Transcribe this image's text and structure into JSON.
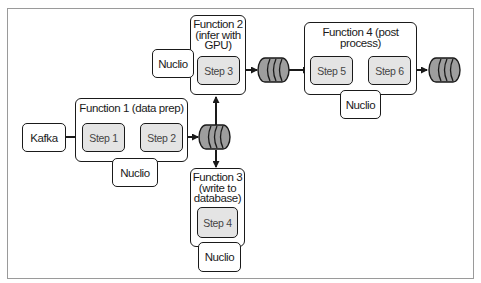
{
  "diagram": {
    "source": {
      "label": "Kafka"
    },
    "functions": [
      {
        "id": "function-1",
        "title": "Function 1 (data prep)",
        "steps": [
          "Step 1",
          "Step 2"
        ],
        "runtime": "Nuclio"
      },
      {
        "id": "function-2",
        "title_lines": [
          "Function 2",
          "(infer with",
          "GPU)"
        ],
        "steps": [
          "Step 3"
        ],
        "runtime": "Nuclio"
      },
      {
        "id": "function-3",
        "title_lines": [
          "Function 3",
          "(write to",
          "database)"
        ],
        "steps": [
          "Step 4"
        ],
        "runtime": "Nuclio"
      },
      {
        "id": "function-4",
        "title_lines": [
          "Function 4 (post",
          "process)"
        ],
        "steps": [
          "Step 5",
          "Step 6"
        ],
        "runtime": "Nuclio"
      }
    ],
    "queues": [
      "queue-after-function-1",
      "queue-after-function-2",
      "queue-after-function-4"
    ],
    "edges": [
      [
        "Kafka",
        "Step 1"
      ],
      [
        "Step 1",
        "Step 2"
      ],
      [
        "Step 2",
        "queue-after-function-1"
      ],
      [
        "queue-after-function-1",
        "Step 3"
      ],
      [
        "queue-after-function-1",
        "Step 4"
      ],
      [
        "Step 3",
        "queue-after-function-2"
      ],
      [
        "queue-after-function-2",
        "Step 5"
      ],
      [
        "Step 5",
        "Step 6"
      ],
      [
        "Step 6",
        "queue-after-function-4"
      ]
    ],
    "colors": {
      "stroke": "#1a1a1a",
      "step_fill": "#e4e4e4",
      "queue_fill": "#9e9e9e",
      "frame": "#9a9a9a"
    }
  }
}
